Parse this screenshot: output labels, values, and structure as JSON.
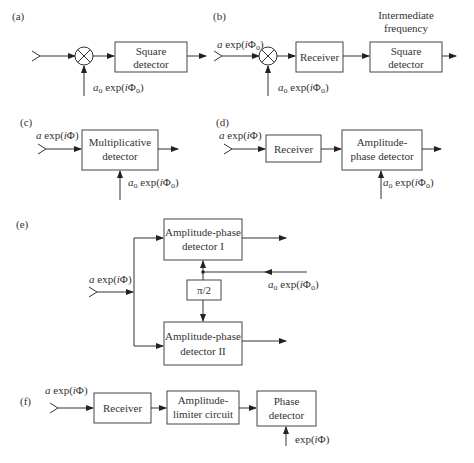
{
  "panels": {
    "a": {
      "label": "(a)",
      "box": "Square detector",
      "box_lines": [
        "Square",
        "detector"
      ],
      "reference": {
        "amp": "a",
        "sub": "o",
        "expr": " exp(iΦ",
        "close": ")"
      }
    },
    "b": {
      "label": "(b)",
      "input": "a exp(iΦo)",
      "receiver": "Receiver",
      "if_label_lines": [
        "Intermediate",
        "frequency"
      ],
      "box_lines": [
        "Square",
        "detector"
      ],
      "reference": "ao exp(iΦo)"
    },
    "c": {
      "label": "(c)",
      "input": "a exp(iΦ)",
      "box_lines": [
        "Multiplicative",
        "detector"
      ],
      "reference": "ao exp(iΦo)"
    },
    "d": {
      "label": "(d)",
      "input": "a exp(iΦ)",
      "receiver": "Receiver",
      "box_lines": [
        "Amplitude-",
        "phase detector"
      ],
      "reference": "ao exp(iΦo)"
    },
    "e": {
      "label": "(e)",
      "input": "a exp(iΦ)",
      "top_box_lines": [
        "Amplitude-phase",
        "detector I"
      ],
      "bottom_box_lines": [
        "Amplitude-phase",
        "detector II"
      ],
      "shifter": "π/2",
      "reference": "ao exp(iΦo)"
    },
    "f": {
      "label": "(f)",
      "input": "a exp(iΦ)",
      "receiver": "Receiver",
      "limiter_lines": [
        "Amplitude-",
        "limiter circuit"
      ],
      "phase_lines": [
        "Phase",
        "detector"
      ],
      "reference": "exp(iΦ)"
    }
  }
}
